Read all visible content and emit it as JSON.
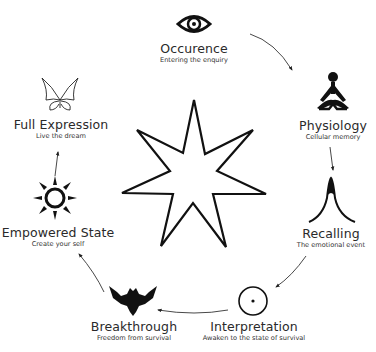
{
  "diagram": {
    "type": "cycle",
    "center_symbol": "seven-point-star",
    "colors": {
      "ink": "#111111",
      "text": "#2a2a2a",
      "background": "#ffffff"
    },
    "nodes": [
      {
        "id": "occurence",
        "title": "Occurence",
        "subtitle": "Entering the enquiry",
        "icon": "eye-icon"
      },
      {
        "id": "physiology",
        "title": "Physiology",
        "subtitle": "Cellular memory",
        "icon": "meditating-figure-icon"
      },
      {
        "id": "recalling",
        "title": "Recalling",
        "subtitle": "The emotional event",
        "icon": "peak-curve-icon"
      },
      {
        "id": "interpretation",
        "title": "Interpretation",
        "subtitle": "Awaken to the state of survival",
        "icon": "circle-dot-icon"
      },
      {
        "id": "breakthrough",
        "title": "Breakthrough",
        "subtitle": "Freedom from survival",
        "icon": "eagle-icon"
      },
      {
        "id": "empowered-state",
        "title": "Empowered State",
        "subtitle": "Create your self",
        "icon": "sun-icon"
      },
      {
        "id": "full-expression",
        "title": "Full Expression",
        "subtitle": "Live the dream",
        "icon": "butterfly-icon"
      }
    ],
    "flow": [
      "occurence",
      "physiology",
      "recalling",
      "interpretation",
      "breakthrough",
      "empowered-state",
      "full-expression"
    ]
  }
}
